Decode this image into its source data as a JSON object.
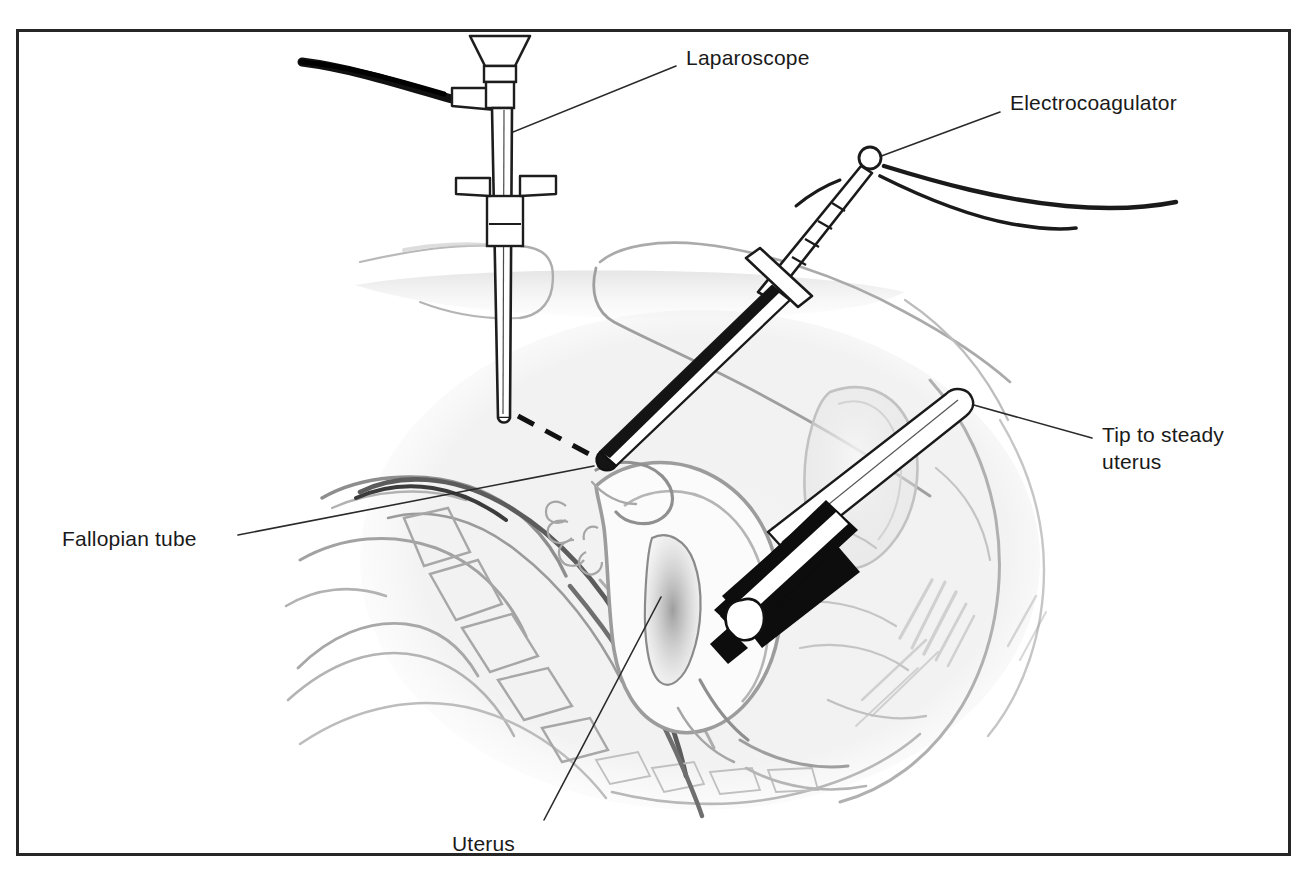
{
  "figure": {
    "medium": "pen-and-ink with pencil wash medical illustration",
    "frame": {
      "border_color": "#222222",
      "background_color": "#ffffff",
      "x": 17,
      "y": 30,
      "width": 1273,
      "height": 825
    },
    "ink_color": "#1a1a1a",
    "wash_color": "#9a9a9a"
  },
  "labels": [
    {
      "id": "laparoscope",
      "text": "Laparoscope",
      "x": 686,
      "y": 44,
      "leader": {
        "x1": 676,
        "y1": 66,
        "x2": 508,
        "y2": 134
      }
    },
    {
      "id": "electrocoagulator",
      "text": "Electrocoagulator",
      "x": 1010,
      "y": 89,
      "leader": {
        "x1": 1000,
        "y1": 112,
        "x2": 876,
        "y2": 158
      }
    },
    {
      "id": "tip-to-steady-uterus",
      "text": "Tip to steady",
      "text_line2": "uterus",
      "x": 1102,
      "y": 421,
      "leader": {
        "x1": 1092,
        "y1": 438,
        "x2": 963,
        "y2": 402
      }
    },
    {
      "id": "fallopian-tube",
      "text": "Fallopian tube",
      "x": 62,
      "y": 525,
      "leader": {
        "x1": 238,
        "y1": 535,
        "x2": 594,
        "y2": 466
      }
    },
    {
      "id": "uterus",
      "text": "Uterus",
      "x": 452,
      "y": 830,
      "leader": {
        "x1": 544,
        "y1": 820,
        "x2": 661,
        "y2": 597
      }
    }
  ],
  "instruments": [
    {
      "id": "laparoscope",
      "parts": [
        "eyepiece-funnel",
        "collar",
        "light-cable-port",
        "shaft",
        "trocar-sleeve",
        "sleeve-wings",
        "distal-tip"
      ],
      "cable_color": "#111111",
      "orientation": "vertical, entering abdomen from above"
    },
    {
      "id": "electrocoagulator",
      "parts": [
        "terminal-knob",
        "power-cable",
        "banded-grip",
        "cross-guard",
        "shaft",
        "coagulating-tip"
      ],
      "shaft_shadow_color": "#151515",
      "orientation": "oblique from upper right down to fallopian tube"
    },
    {
      "id": "uterine-manipulator",
      "parts": [
        "white-rod",
        "black-shaft",
        "white-cervical-tip"
      ],
      "shaft_color": "#0d0d0d",
      "orientation": "oblique from lower right up into cervix"
    }
  ],
  "anatomy": [
    {
      "id": "abdominal-wall",
      "label": "abdominal wall"
    },
    {
      "id": "bowel-loops",
      "label": "bowel loops"
    },
    {
      "id": "sacrum-vertebrae",
      "label": "sacrum and vertebrae"
    },
    {
      "id": "bladder",
      "label": "bladder"
    },
    {
      "id": "uterus-body",
      "label": "uterus"
    },
    {
      "id": "endometrial-cavity",
      "label": "endometrial cavity"
    },
    {
      "id": "fallopian-tube",
      "label": "fallopian tube"
    },
    {
      "id": "fimbriae",
      "label": "fimbriated end"
    },
    {
      "id": "cervix",
      "label": "cervix"
    },
    {
      "id": "vagina",
      "label": "vagina"
    },
    {
      "id": "rectum",
      "label": "rectum"
    }
  ],
  "annotations": {
    "sight_line": {
      "style": "dashed",
      "description": "line of sight from laparoscope tip to electrocoagulator tip"
    }
  }
}
